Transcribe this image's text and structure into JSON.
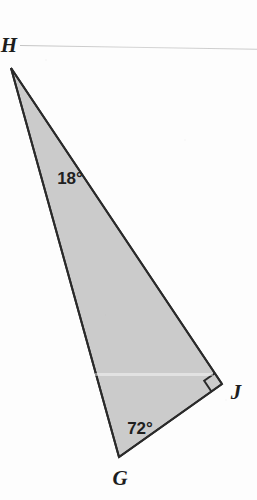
{
  "figure": {
    "kind": "geometry-diagram",
    "shape": "right-triangle",
    "background_color": "#fdfdfd",
    "fill_color": "#cbcbcb",
    "stroke_color": "#2a2a2a",
    "stroke_width": 2,
    "label_color": "#1d1d1d"
  },
  "vertices": [
    {
      "name": "H",
      "label": "H",
      "x": 11,
      "y": 68,
      "label_x": 9,
      "label_y": 45
    },
    {
      "name": "G",
      "label": "G",
      "x": 119,
      "y": 457,
      "label_x": 120,
      "label_y": 478
    },
    {
      "name": "J",
      "label": "J",
      "x": 222,
      "y": 384,
      "label_x": 236,
      "label_y": 392
    }
  ],
  "angles": [
    {
      "at": "H",
      "label": "18°",
      "value": 18,
      "label_x": 70,
      "label_y": 178
    },
    {
      "at": "G",
      "label": "72°",
      "value": 72,
      "label_x": 140,
      "label_y": 428
    },
    {
      "at": "J",
      "label": "",
      "value": 90,
      "marker": "right-angle-square"
    }
  ],
  "edges": [
    {
      "from": "H",
      "to": "G"
    },
    {
      "from": "G",
      "to": "J"
    },
    {
      "from": "J",
      "to": "H"
    }
  ],
  "artifacts": {
    "top_scan_line": "faint gray horizontal scan line",
    "mid_scan_band": "faint light horizontal band"
  }
}
